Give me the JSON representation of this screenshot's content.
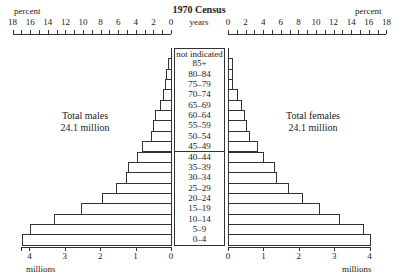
{
  "chart_data": {
    "type": "bar",
    "subtype": "population-pyramid",
    "title": "1970 Census",
    "center_label": "years",
    "top_axis": {
      "label_left": "percent",
      "label_right": "percent",
      "ticks": [
        0,
        2,
        4,
        6,
        8,
        10,
        12,
        14,
        16,
        18
      ],
      "range": [
        0,
        18
      ]
    },
    "bottom_axis": {
      "label": "millions",
      "ticks": [
        0,
        1,
        2,
        3,
        4
      ],
      "range": [
        0,
        4
      ]
    },
    "categories": [
      "not indicated",
      "85+",
      "80–84",
      "75–79",
      "70–74",
      "65–69",
      "60–64",
      "55–59",
      "50–54",
      "45–49",
      "40–44",
      "35–39",
      "30–34",
      "25–29",
      "20–24",
      "15–19",
      "10–14",
      "5–9",
      "0–4"
    ],
    "series": [
      {
        "name": "Total males",
        "total": "24.1 million",
        "values": [
          0.0,
          0.08,
          0.14,
          0.17,
          0.23,
          0.31,
          0.45,
          0.51,
          0.56,
          0.82,
          0.96,
          1.21,
          1.27,
          1.55,
          1.94,
          2.53,
          3.3,
          3.97,
          4.2
        ]
      },
      {
        "name": "Total females",
        "total": "24.1 million",
        "values": [
          0.0,
          0.11,
          0.11,
          0.11,
          0.25,
          0.37,
          0.45,
          0.51,
          0.6,
          0.82,
          0.99,
          1.3,
          1.36,
          1.7,
          2.1,
          2.58,
          3.14,
          3.8,
          4.02
        ]
      }
    ],
    "xlabel": "millions",
    "ylabel": "years",
    "grid": false,
    "legend": "none"
  },
  "labels": {
    "title": "1970 Census",
    "years": "years",
    "percent_left": "percent",
    "percent_right": "percent",
    "millions_left": "millions",
    "millions_right": "millions",
    "males_line1": "Total males",
    "males_line2": "24.1 million",
    "females_line1": "Total females",
    "females_line2": "24.1 million"
  }
}
